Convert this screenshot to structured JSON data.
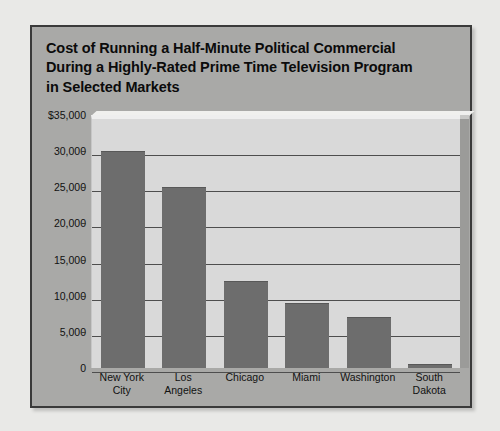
{
  "chart_data": {
    "type": "bar",
    "title": "Cost of Running a Half-Minute Political Commercial During a Highly-Rated Prime Time Television Program in Selected Markets",
    "title_lines": [
      "Cost of Running a Half-Minute Political Commercial",
      "During a Highly-Rated Prime Time Television Program",
      "in Selected Markets"
    ],
    "categories": [
      "New York City",
      "Los Angeles",
      "Chicago",
      "Miami",
      "Washington",
      "South Dakota"
    ],
    "category_lines": [
      [
        "New York",
        "City"
      ],
      [
        "Los",
        "Angeles"
      ],
      [
        "Chicago"
      ],
      [
        "Miami"
      ],
      [
        "Washington"
      ],
      [
        "South",
        "Dakota"
      ]
    ],
    "values": [
      30000,
      25000,
      12000,
      9000,
      7000,
      600
    ],
    "xlabel": "",
    "ylabel": "",
    "ylim": [
      0,
      35000
    ],
    "ytick_values": [
      35000,
      30000,
      25000,
      20000,
      15000,
      10000,
      5000,
      0
    ],
    "ytick_labels": [
      "$35,000",
      "30,000",
      "25,000",
      "20,000",
      "15,000",
      "10,000",
      "5,000",
      "0"
    ],
    "grid": true,
    "legend": null,
    "colors": {
      "bar": "#6d6d6d",
      "plot_background": "#d9d9d9",
      "panel_background": "#a9a9a7",
      "page_background": "#e9e9e7",
      "gridline": "#4e4e4e",
      "text": "#111111",
      "frame_border": "#3a3a3a"
    }
  }
}
